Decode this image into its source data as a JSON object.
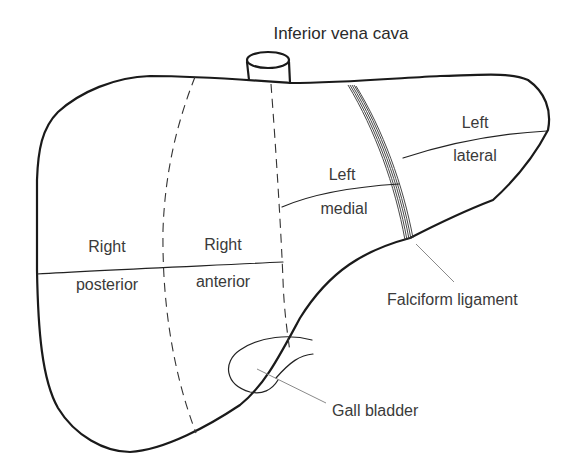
{
  "diagram": {
    "title_label": "Inferior vena cava",
    "segments": [
      {
        "line1": "Right",
        "line2": "posterior"
      },
      {
        "line1": "Right",
        "line2": "anterior"
      },
      {
        "line1": "Left",
        "line2": "medial"
      },
      {
        "line1": "Left",
        "line2": "lateral"
      }
    ],
    "callouts": {
      "falciform": "Falciform ligament",
      "gallbladder": "Gall bladder"
    },
    "colors": {
      "background": "#ffffff",
      "stroke": "#1a1a1a",
      "text": "#3a3a3a",
      "leader": "#8a8a8a"
    }
  }
}
